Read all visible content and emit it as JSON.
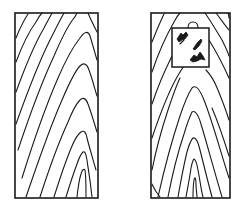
{
  "figure": {
    "panels": [
      {
        "id": "left",
        "label": "Wood board with plain grain (no defect)",
        "bounds": {
          "x": 15,
          "y": 13,
          "width": 83,
          "height": 185
        }
      },
      {
        "id": "right",
        "label": "Wood board with inserted square patch containing defect marks",
        "bounds": {
          "x": 151,
          "y": 13,
          "width": 79,
          "height": 185
        },
        "patch": {
          "x": 172,
          "y": 28,
          "width": 37,
          "height": 39,
          "marks": 3
        }
      }
    ],
    "colors": {
      "line": "#1a1a1a",
      "background": "#ffffff"
    }
  }
}
